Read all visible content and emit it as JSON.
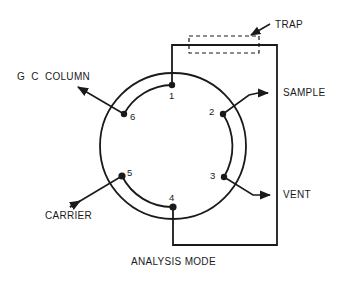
{
  "diagram": {
    "title": "ANALYSIS MODE",
    "labels": {
      "trap": "TRAP",
      "gc_column": "G  C  COLUMN",
      "sample": "SAMPLE",
      "vent": "VENT",
      "carrier": "CARRIER"
    },
    "ports": [
      {
        "id": 1,
        "label": "1"
      },
      {
        "id": 2,
        "label": "2"
      },
      {
        "id": 3,
        "label": "3"
      },
      {
        "id": 4,
        "label": "4"
      },
      {
        "id": 5,
        "label": "5"
      },
      {
        "id": 6,
        "label": "6"
      }
    ],
    "connections": [
      {
        "from": "6",
        "to": "1",
        "type": "internal-arc"
      },
      {
        "from": "2",
        "to": "3",
        "type": "internal-arc"
      },
      {
        "from": "5",
        "to": "4",
        "type": "internal-arc"
      },
      {
        "from": "1",
        "to": "4",
        "type": "external-loop",
        "via": "TRAP"
      },
      {
        "from": "SAMPLE",
        "to": "2",
        "type": "inlet"
      },
      {
        "from": "3",
        "to": "VENT",
        "type": "outlet"
      },
      {
        "from": "CARRIER",
        "to": "5",
        "type": "inlet"
      },
      {
        "from": "6",
        "to": "G C COLUMN",
        "type": "outlet"
      }
    ],
    "line_color": "#1a1a1a"
  }
}
